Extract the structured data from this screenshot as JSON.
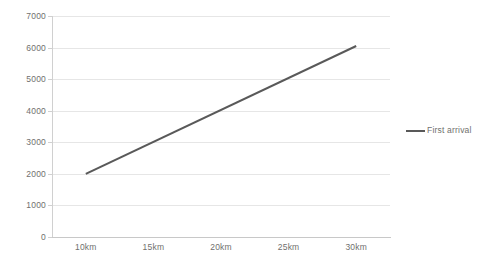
{
  "chart_data": {
    "type": "line",
    "title": "",
    "xlabel": "",
    "ylabel": "",
    "x": [
      "10km",
      "15km",
      "20km",
      "25km",
      "30km"
    ],
    "categories": [
      "10km",
      "15km",
      "20km",
      "25km",
      "30km"
    ],
    "series": [
      {
        "name": "First arrival",
        "color": "#595959",
        "points": [
          {
            "x": "10km",
            "y": 2000
          },
          {
            "x": "30km",
            "y": 6050
          }
        ],
        "values": [
          2000,
          3010,
          4020,
          5030,
          6050
        ]
      }
    ],
    "ylim": [
      0,
      7000
    ],
    "yticks": [
      0,
      1000,
      2000,
      3000,
      4000,
      5000,
      6000,
      7000
    ],
    "ytick_labels": [
      "0",
      "1000",
      "2000",
      "3000",
      "4000",
      "5000",
      "6000",
      "7000"
    ],
    "xtick_labels": [
      "10km",
      "15km",
      "20km",
      "25km",
      "30km"
    ],
    "grid": true,
    "grid_axis": "y",
    "legend": {
      "position": "right",
      "entries": [
        {
          "label": "First arrival",
          "color": "#595959"
        }
      ]
    },
    "colors": {
      "series": "#595959",
      "gridline": "#e6e6e6",
      "axis": "#d0d0d0",
      "tick_text": "#70706e",
      "background": "#ffffff"
    }
  }
}
